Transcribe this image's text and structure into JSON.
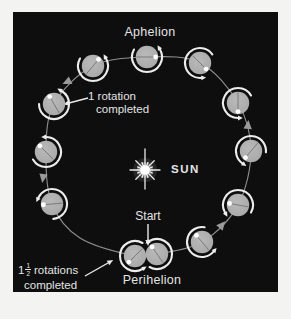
{
  "page": {
    "background": "#f3f3f1"
  },
  "figure": {
    "background": "#0e0e0e",
    "colors": {
      "planet": "#a8a8a8",
      "planet_highlight": "#b9b9b9",
      "planet_line": "#6e6e6e",
      "dot": "#ffffff",
      "arc": "#ededed",
      "orbit": "#8f8f8f",
      "orbit_arrow": "#9a9a9a",
      "label_arrow": "#e9e9e9",
      "text": "#e4e4e4",
      "sun": "#ffffff"
    },
    "labels": {
      "aphelion": "Aphelion",
      "sun": "SUN",
      "start": "Start",
      "perihelion": "Perihelion",
      "one_rotation": {
        "line1": "1 rotation",
        "line2": "completed"
      },
      "one_and_half": {
        "whole": "1",
        "numerator": "1",
        "denominator": "2",
        "rest": "rotations",
        "line2": "completed"
      }
    },
    "diagram": {
      "planet_radius": 11.2,
      "arc_radius": 15,
      "dot_radius": 2.4,
      "sun": {
        "cx": 132,
        "cy": 158,
        "rays": [
          {
            "a": 90,
            "l": 21
          },
          {
            "a": 270,
            "l": 19
          },
          {
            "a": 0,
            "l": 15
          },
          {
            "a": 180,
            "l": 15
          },
          {
            "a": 45,
            "l": 13
          },
          {
            "a": 135,
            "l": 13
          },
          {
            "a": 225,
            "l": 13
          },
          {
            "a": 315,
            "l": 13
          },
          {
            "a": 22,
            "l": 8
          },
          {
            "a": 68,
            "l": 8
          },
          {
            "a": 112,
            "l": 8
          },
          {
            "a": 158,
            "l": 8
          },
          {
            "a": 202,
            "l": 8
          },
          {
            "a": 248,
            "l": 8
          },
          {
            "a": 292,
            "l": 8
          },
          {
            "a": 338,
            "l": 8
          }
        ]
      },
      "orbit_path_points": [
        [
          134,
          45
        ],
        [
          80,
          54
        ],
        [
          41,
          92
        ],
        [
          33,
          140
        ],
        [
          39,
          192
        ],
        [
          67,
          226
        ],
        [
          122,
          244
        ],
        [
          144,
          242
        ],
        [
          189,
          230
        ],
        [
          225,
          193
        ],
        [
          238,
          139
        ],
        [
          225,
          91
        ],
        [
          187,
          51
        ]
      ],
      "planets": [
        {
          "name": "aphelion-position",
          "x": 134,
          "y": 45,
          "dot": 0,
          "gap": 90
        },
        {
          "name": "upper-right-position",
          "x": 187,
          "y": 51,
          "dot": 315,
          "gap": 335
        },
        {
          "name": "right-upper-position",
          "x": 225,
          "y": 91,
          "dot": 270,
          "gap": 330
        },
        {
          "name": "right-position",
          "x": 238,
          "y": 139,
          "dot": 230,
          "gap": 295
        },
        {
          "name": "right-lower-position",
          "x": 225,
          "y": 193,
          "dot": 170,
          "gap": 270
        },
        {
          "name": "bottom-right-position",
          "x": 189,
          "y": 230,
          "dot": 130,
          "gap": 20
        },
        {
          "name": "perihelion-end-position",
          "x": 144,
          "y": 242,
          "dot": 125,
          "gap": 180
        },
        {
          "name": "perihelion-start-position",
          "x": 122,
          "y": 244,
          "dot": 225,
          "gap": 0
        },
        {
          "name": "bottom-left-position",
          "x": 39,
          "y": 192,
          "dot": 185,
          "gap": 215
        },
        {
          "name": "left-position",
          "x": 33,
          "y": 140,
          "dot": 135,
          "gap": 150
        },
        {
          "name": "one-rotation-position",
          "x": 41,
          "y": 92,
          "dot": 120,
          "gap": 120
        },
        {
          "name": "upper-left-position",
          "x": 80,
          "y": 54,
          "dot": 50,
          "gap": 90
        }
      ],
      "orbit_arrows": [
        {
          "x": 54,
          "y": 70,
          "dir": 205
        },
        {
          "x": 30,
          "y": 166,
          "dir": 262
        },
        {
          "x": 209,
          "y": 213,
          "dir": 50
        },
        {
          "x": 235,
          "y": 113,
          "dir": 85
        }
      ],
      "label_arrows": [
        {
          "name": "one-rotation-pointer",
          "x1": 75,
          "y1": 86,
          "x2": 56,
          "y2": 91
        },
        {
          "name": "start-pointer",
          "x1": 135,
          "y1": 212,
          "x2": 135,
          "y2": 228
        },
        {
          "name": "one-and-half-pointer",
          "x1": 72,
          "y1": 264,
          "x2": 95,
          "y2": 251
        }
      ]
    }
  }
}
